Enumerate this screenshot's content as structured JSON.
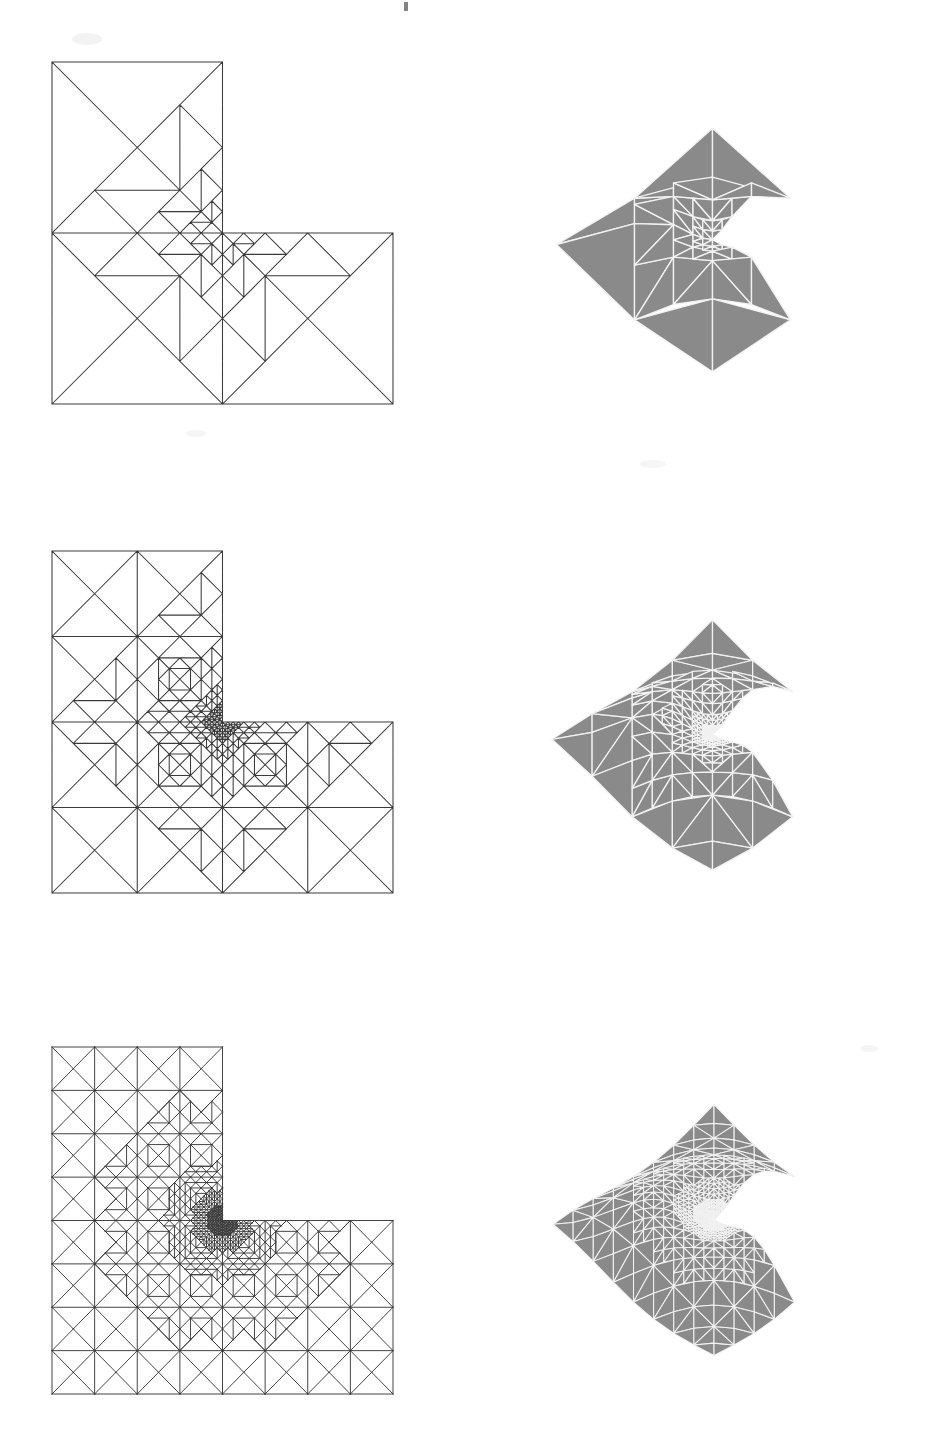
{
  "figure": {
    "background_color": "#ffffff",
    "mesh_line_color": "#3a3a3a",
    "surface_fill_color": "#8a8a8a",
    "surface_edge_color": "#f2f2f2",
    "rows": 3,
    "columns": 2
  },
  "chart_data": {
    "type": "diagram",
    "title": "Adaptive mesh refinement sequence on L-shaped domain",
    "panels": [
      {
        "id": "mesh-level-1",
        "label": "Mesh level 1",
        "kind": "triangular-mesh",
        "domain": "L-shaped",
        "origin": [
          52,
          62
        ],
        "size": [
          341,
          342
        ],
        "reentrant_corner": [
          222,
          233
        ],
        "base_grid": 2,
        "refinement_levels": 3,
        "approx_triangle_count": 44
      },
      {
        "id": "surface-level-1",
        "label": "Solution surface level 1",
        "kind": "3d-surface",
        "center": [
          712,
          252
        ],
        "width": 340,
        "height": 150,
        "mesh_density": 1
      },
      {
        "id": "mesh-level-2",
        "label": "Mesh level 2",
        "kind": "triangular-mesh",
        "domain": "L-shaped",
        "origin": [
          52,
          551
        ],
        "size": [
          341,
          342
        ],
        "reentrant_corner": [
          222,
          722
        ],
        "base_grid": 4,
        "refinement_levels": 4,
        "approx_triangle_count": 188
      },
      {
        "id": "surface-level-2",
        "label": "Solution surface level 2",
        "kind": "3d-surface",
        "center": [
          712,
          745
        ],
        "width": 350,
        "height": 160,
        "mesh_density": 2
      },
      {
        "id": "mesh-level-3",
        "label": "Mesh level 3",
        "kind": "triangular-mesh",
        "domain": "L-shaped",
        "origin": [
          52,
          1047
        ],
        "size": [
          341,
          347
        ],
        "reentrant_corner": [
          222,
          1220
        ],
        "base_grid": 8,
        "refinement_levels": 5,
        "approx_triangle_count": 760
      },
      {
        "id": "surface-level-3",
        "label": "Solution surface level 3",
        "kind": "3d-surface",
        "center": [
          712,
          1232
        ],
        "width": 352,
        "height": 170,
        "mesh_density": 4
      }
    ]
  }
}
